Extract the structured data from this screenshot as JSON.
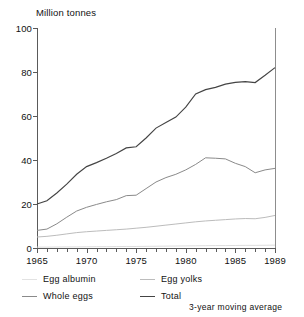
{
  "chart_data": {
    "type": "line",
    "title": "",
    "subtitle": "",
    "unit_label": "Million tonnes",
    "xlabel": "",
    "ylabel": "Million tonnes",
    "xlim": [
      1965,
      1989
    ],
    "ylim": [
      0,
      100
    ],
    "grid": false,
    "legend_position": "below-plot",
    "annotation": "3-year moving average",
    "y_ticks": [
      0,
      20,
      40,
      60,
      80,
      100
    ],
    "y_tick_labels": [
      "0",
      "20",
      "40",
      "60",
      "80",
      "100"
    ],
    "x_ticks": [
      1965,
      1970,
      1975,
      1980,
      1985,
      1989
    ],
    "x_tick_labels": [
      "1965",
      "1970",
      "1975",
      "1980",
      "1985",
      "1989"
    ],
    "x_minor_ticks": [
      1966,
      1967,
      1968,
      1969,
      1971,
      1972,
      1973,
      1974,
      1976,
      1977,
      1978,
      1979,
      1981,
      1982,
      1983,
      1984,
      1986,
      1987,
      1988
    ],
    "x": [
      1965,
      1966,
      1967,
      1968,
      1969,
      1970,
      1971,
      1972,
      1973,
      1974,
      1975,
      1976,
      1977,
      1978,
      1979,
      1980,
      1981,
      1982,
      1983,
      1984,
      1985,
      1986,
      1987,
      1988,
      1989
    ],
    "series": [
      {
        "name": "Total",
        "color": "#444444",
        "values": [
          20.0,
          21.5,
          25.0,
          29.0,
          33.5,
          37.0,
          38.8,
          40.8,
          43.0,
          45.5,
          46.0,
          50.0,
          54.5,
          57.0,
          59.5,
          64.0,
          70.0,
          72.0,
          73.0,
          74.5,
          75.3,
          75.6,
          75.2,
          78.5,
          82.0
        ]
      },
      {
        "name": "Whole eggs",
        "color": "#8a8a8a",
        "values": [
          8.0,
          8.6,
          11.0,
          14.0,
          16.8,
          18.5,
          19.8,
          21.0,
          22.0,
          23.8,
          24.0,
          27.0,
          30.0,
          32.0,
          33.5,
          35.5,
          38.0,
          41.0,
          40.8,
          40.5,
          38.5,
          37.0,
          34.2,
          35.5,
          36.2
        ]
      },
      {
        "name": "Egg yolks",
        "color": "#bcbcbc",
        "values": [
          5.0,
          5.3,
          5.8,
          6.4,
          7.0,
          7.4,
          7.7,
          8.0,
          8.3,
          8.6,
          9.0,
          9.4,
          9.9,
          10.4,
          10.9,
          11.4,
          11.9,
          12.3,
          12.6,
          12.9,
          13.2,
          13.4,
          13.3,
          13.9,
          14.8
        ]
      },
      {
        "name": "Egg albumin",
        "color": "#d8d8d8",
        "values": [
          0.4,
          0.4,
          0.45,
          0.5,
          0.5,
          0.55,
          0.6,
          0.6,
          0.65,
          0.7,
          0.7,
          0.75,
          0.8,
          0.85,
          0.9,
          0.95,
          1.0,
          1.05,
          1.1,
          1.1,
          1.15,
          1.2,
          1.2,
          1.25,
          1.3
        ]
      }
    ]
  },
  "legend": {
    "entries": [
      {
        "label": "Egg albumin",
        "swatch_class": "sw-albumin"
      },
      {
        "label": "Egg yolks",
        "swatch_class": "sw-yolks"
      },
      {
        "label": "Whole eggs",
        "swatch_class": "sw-whole"
      },
      {
        "label": "Total",
        "swatch_class": "sw-total"
      }
    ],
    "note": "3-year moving average"
  },
  "colors": {
    "total": "#444444",
    "whole_eggs": "#8a8a8a",
    "egg_yolks": "#bcbcbc",
    "egg_albumin": "#d8d8d8",
    "axis": "#5a5a5a",
    "text": "#111111",
    "background": "#ffffff"
  }
}
